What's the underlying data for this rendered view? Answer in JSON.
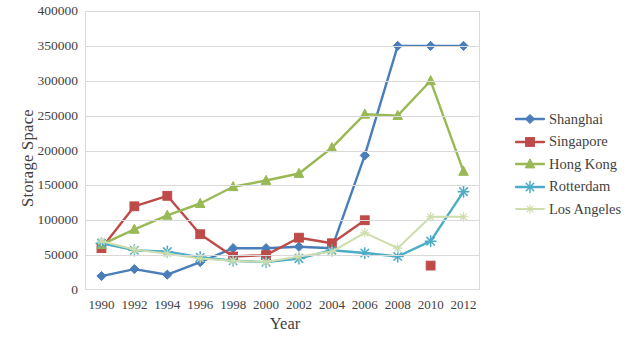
{
  "chart_data": {
    "type": "line",
    "title": "",
    "xlabel": "Year",
    "ylabel": "Storage Space",
    "x": [
      1990,
      1992,
      1994,
      1996,
      1998,
      2000,
      2002,
      2004,
      2006,
      2008,
      2010,
      2012
    ],
    "xtick_labels": [
      "1990",
      "1992",
      "1994",
      "1996",
      "1998",
      "2000",
      "2002",
      "2004",
      "2006",
      "2008",
      "2010",
      "2012"
    ],
    "ytick_labels": [
      "0",
      "50000",
      "100000",
      "150000",
      "200000",
      "250000",
      "300000",
      "350000",
      "400000"
    ],
    "ytick_values": [
      0,
      50000,
      100000,
      150000,
      200000,
      250000,
      300000,
      350000,
      400000
    ],
    "ylim": [
      0,
      400000
    ],
    "xlim": [
      1990,
      2012
    ],
    "grid": "horizontal",
    "legend_position": "right",
    "series": [
      {
        "name": "Shanghai",
        "color": "#4a7ebb",
        "marker": "diamond",
        "values": [
          20000,
          30000,
          22000,
          40000,
          60000,
          60000,
          62000,
          60000,
          193000,
          350000,
          350000,
          350000
        ]
      },
      {
        "name": "Singapore",
        "color": "#be4b48",
        "marker": "square",
        "values": [
          60000,
          120000,
          135000,
          80000,
          48000,
          50000,
          75000,
          67000,
          100000,
          null,
          35000,
          null
        ]
      },
      {
        "name": "Hong Kong",
        "color": "#98b954",
        "marker": "triangle",
        "values": [
          65000,
          87000,
          107000,
          124000,
          148000,
          157000,
          167000,
          204000,
          252000,
          250000,
          300000,
          170000
        ]
      },
      {
        "name": "Rotterdam",
        "color": "#4bacc6",
        "marker": "star",
        "values": [
          67000,
          57000,
          55000,
          47000,
          42000,
          40000,
          45000,
          57000,
          53000,
          48000,
          70000,
          141000
        ]
      },
      {
        "name": "Los Angeles",
        "color": "#cdddac",
        "marker": "star-small",
        "values": [
          70000,
          58000,
          52000,
          45000,
          42000,
          40000,
          48000,
          55000,
          82000,
          60000,
          105000,
          105000
        ]
      }
    ]
  },
  "axes": {
    "x_title": "Year",
    "y_title": "Storage Space"
  },
  "legend": {
    "items": [
      {
        "label": "Shanghai"
      },
      {
        "label": "Singapore"
      },
      {
        "label": "Hong Kong"
      },
      {
        "label": "Rotterdam"
      },
      {
        "label": "Los Angeles"
      }
    ]
  }
}
